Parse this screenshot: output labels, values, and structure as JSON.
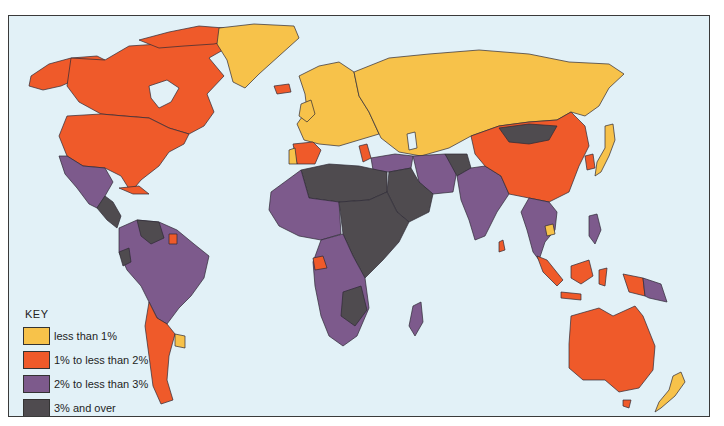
{
  "map": {
    "type": "choropleth world map",
    "subject": "growth rate by country (percent categories)",
    "ocean_color": "#e2f1f7",
    "border_color": "#2e2a35"
  },
  "legend": {
    "title": "KEY",
    "items": [
      {
        "label": "less than 1%",
        "color": "#f7c24a",
        "category": "low"
      },
      {
        "label": "1% to less than 2%",
        "color": "#ef5a2a",
        "category": "medium-low"
      },
      {
        "label": "2% to less than 3%",
        "color": "#7d5a8c",
        "category": "medium-high"
      },
      {
        "label": "3% and over",
        "color": "#4f4b4f",
        "category": "high"
      }
    ]
  },
  "regions": [
    {
      "name": "Canada",
      "category": "medium-low"
    },
    {
      "name": "United States",
      "category": "medium-low"
    },
    {
      "name": "Alaska",
      "category": "medium-low"
    },
    {
      "name": "Greenland",
      "category": "low"
    },
    {
      "name": "Iceland",
      "category": "medium-low"
    },
    {
      "name": "Mexico",
      "category": "medium-high"
    },
    {
      "name": "Central America",
      "category": "high"
    },
    {
      "name": "Cuba",
      "category": "medium-low"
    },
    {
      "name": "Venezuela",
      "category": "high"
    },
    {
      "name": "Guyana / Suriname",
      "category": "medium-low"
    },
    {
      "name": "Brazil",
      "category": "medium-high"
    },
    {
      "name": "Ecuador",
      "category": "high"
    },
    {
      "name": "Chile",
      "category": "medium-low"
    },
    {
      "name": "Argentina",
      "category": "medium-low"
    },
    {
      "name": "Uruguay",
      "category": "low"
    },
    {
      "name": "Europe",
      "category": "low"
    },
    {
      "name": "Spain",
      "category": "medium-low"
    },
    {
      "name": "Portugal",
      "category": "low"
    },
    {
      "name": "Greece",
      "category": "medium-low"
    },
    {
      "name": "USSR",
      "category": "low"
    },
    {
      "name": "North Africa (Algeria, Libya)",
      "category": "high"
    },
    {
      "name": "West and Central Africa",
      "category": "medium-high"
    },
    {
      "name": "Sudan / East Africa",
      "category": "high"
    },
    {
      "name": "Gabon",
      "category": "medium-low"
    },
    {
      "name": "Madagascar",
      "category": "medium-high"
    },
    {
      "name": "Middle East (Arabia, Iraq)",
      "category": "high"
    },
    {
      "name": "Turkey / Iran",
      "category": "medium-high"
    },
    {
      "name": "Afghanistan",
      "category": "high"
    },
    {
      "name": "India",
      "category": "medium-high"
    },
    {
      "name": "Sri Lanka",
      "category": "medium-low"
    },
    {
      "name": "China",
      "category": "medium-low"
    },
    {
      "name": "Mongolia",
      "category": "high"
    },
    {
      "name": "Japan",
      "category": "low"
    },
    {
      "name": "Korea",
      "category": "medium-low"
    },
    {
      "name": "Southeast Asia",
      "category": "medium-high"
    },
    {
      "name": "Cambodia",
      "category": "low"
    },
    {
      "name": "Indonesia",
      "category": "medium-low"
    },
    {
      "name": "Philippines",
      "category": "medium-high"
    },
    {
      "name": "Papua New Guinea",
      "category": "medium-high"
    },
    {
      "name": "Australia",
      "category": "medium-low"
    },
    {
      "name": "New Zealand",
      "category": "low"
    }
  ]
}
